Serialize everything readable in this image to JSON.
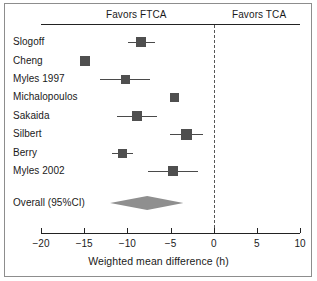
{
  "figure": {
    "width": 317,
    "height": 281,
    "background": "#ffffff",
    "border_color": "#8d8d8d"
  },
  "headers": {
    "left_label": "Favors FTCA",
    "right_label": "Favors TCA"
  },
  "colors": {
    "marker": "#4f4f4f",
    "whisker": "#4a4a4a",
    "diamond": "#8f8f8f",
    "axis": "#222222",
    "zero_line": "#555555",
    "text": "#1a1a1a"
  },
  "chart_data": {
    "type": "forest",
    "title": "",
    "xlabel": "Weighted mean difference (h)",
    "ylabel": "",
    "xlim": [
      -20,
      10
    ],
    "xticks": [
      -20,
      -15,
      -10,
      -5,
      0,
      5,
      10
    ],
    "xticklabels": [
      "−20",
      "−15",
      "−10",
      "−5",
      "0",
      "5",
      "10"
    ],
    "grid": false,
    "null_line": 0,
    "favors_left": "Favors FTCA",
    "favors_right": "Favors TCA",
    "studies": [
      {
        "label": "Slogoff",
        "mean": -8.4,
        "ci_low": -9.9,
        "ci_high": -6.8,
        "marker_size": 10
      },
      {
        "label": "Cheng",
        "mean": -14.9,
        "ci_low": -14.9,
        "ci_high": -14.9,
        "marker_size": 10
      },
      {
        "label": "Myles 1997",
        "mean": -10.2,
        "ci_low": -13.2,
        "ci_high": -7.4,
        "marker_size": 9
      },
      {
        "label": "Michalopoulos",
        "mean": -4.5,
        "ci_low": -4.5,
        "ci_high": -4.5,
        "marker_size": 9
      },
      {
        "label": "Sakaida",
        "mean": -8.9,
        "ci_low": -11.2,
        "ci_high": -6.6,
        "marker_size": 10
      },
      {
        "label": "Silbert",
        "mean": -3.1,
        "ci_low": -5.1,
        "ci_high": -1.2,
        "marker_size": 11
      },
      {
        "label": "Berry",
        "mean": -10.6,
        "ci_low": -11.8,
        "ci_high": -9.4,
        "marker_size": 9
      },
      {
        "label": "Myles 2002",
        "mean": -4.7,
        "ci_low": -7.6,
        "ci_high": -1.8,
        "marker_size": 10
      }
    ],
    "summary": {
      "label": "Overall (95%CI)",
      "mean": -7.7,
      "ci_low": -12.0,
      "ci_high": -3.5
    }
  },
  "labels": {
    "rows": [
      "Slogoff",
      "Cheng",
      "Myles 1997",
      "Michalopoulos",
      "Sakaida",
      "Silbert",
      "Berry",
      "Myles 2002"
    ],
    "summary": "Overall (95%CI)",
    "axis_title": "Weighted mean difference (h)"
  },
  "geometry": {
    "x_axis_px": {
      "x_min": 41,
      "x_max": 300,
      "v_min": -20,
      "v_max": 10
    },
    "row_y": [
      42,
      61,
      79,
      97,
      116,
      134,
      153,
      171
    ],
    "summary_y": 203,
    "label_x": 13
  }
}
